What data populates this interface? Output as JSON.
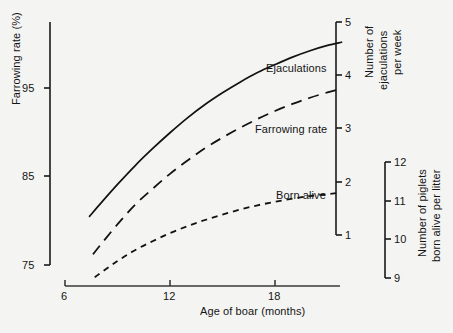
{
  "chart_data": {
    "type": "line",
    "title": "",
    "subtitle": "",
    "xlabel": "Age of boar (months)",
    "xlim": [
      6,
      24
    ],
    "xticks": [
      6,
      12,
      18
    ],
    "xtick_labels": [
      "6",
      "12",
      "18"
    ],
    "grid": false,
    "legend_position": "inline-annotations",
    "axes": [
      {
        "id": "left",
        "side": "left",
        "title": "Farrowing rate (%)",
        "lim": [
          75,
          100
        ],
        "ticks": [
          75,
          85,
          95
        ],
        "tick_labels": [
          "75",
          "85",
          "95"
        ]
      },
      {
        "id": "right-ejaculations",
        "side": "right",
        "title": "Number of ejaculations per week",
        "lim": [
          1,
          5
        ],
        "ticks": [
          1,
          2,
          3,
          4,
          5
        ],
        "tick_labels": [
          "1",
          "2",
          "3",
          "4",
          "5"
        ]
      },
      {
        "id": "right-piglets",
        "side": "right",
        "title": "Number of piglets born alive per litter",
        "lim": [
          9,
          12
        ],
        "ticks": [
          9,
          10,
          11,
          12
        ],
        "tick_labels": [
          "9",
          "10",
          "11",
          "12"
        ]
      }
    ],
    "series": [
      {
        "name": "Ejaculations",
        "axis": "right-ejaculations",
        "style": "solid",
        "label_text": "Ejaculations",
        "x": [
          7.4,
          8.0,
          9.0,
          10.0,
          11.0,
          12.0,
          13.0,
          14.0,
          15.0,
          16.0,
          17.0,
          18.0,
          19.0,
          20.0,
          21.0,
          21.8
        ],
        "y": [
          1.35,
          1.58,
          1.95,
          2.3,
          2.62,
          2.92,
          3.2,
          3.45,
          3.67,
          3.87,
          4.05,
          4.2,
          4.34,
          4.46,
          4.56,
          4.62
        ]
      },
      {
        "name": "Farrowing rate",
        "axis": "left",
        "style": "dashed-long",
        "label_text": "Farrowing rate",
        "x": [
          7.6,
          8.0,
          9.0,
          10.0,
          11.0,
          12.0,
          13.0,
          14.0,
          15.0,
          16.0,
          17.0,
          18.0,
          19.0,
          20.0,
          21.0,
          21.8
        ],
        "y": [
          76.2,
          77.2,
          79.6,
          81.8,
          83.6,
          85.3,
          86.8,
          88.2,
          89.4,
          90.5,
          91.5,
          92.4,
          93.2,
          93.9,
          94.5,
          94.9
        ]
      },
      {
        "name": "Born alive",
        "axis": "right-piglets",
        "style": "dashed-short",
        "label_text": "Born alive",
        "x": [
          7.7,
          8.0,
          9.0,
          10.0,
          11.0,
          12.0,
          13.0,
          14.0,
          15.0,
          16.0,
          17.0,
          18.0,
          19.0,
          20.0,
          21.0,
          21.6
        ],
        "y": [
          9.02,
          9.12,
          9.44,
          9.72,
          9.95,
          10.16,
          10.34,
          10.5,
          10.64,
          10.77,
          10.88,
          10.97,
          11.05,
          11.12,
          11.17,
          11.2
        ]
      }
    ],
    "annotations": [
      {
        "text": "Ejaculations",
        "x": 17.6,
        "y_px": 68
      },
      {
        "text": "Farrowing rate",
        "x": 17.0,
        "y_px": 129
      },
      {
        "text": "Born alive",
        "x": 18.2,
        "y_px": 195
      }
    ]
  }
}
